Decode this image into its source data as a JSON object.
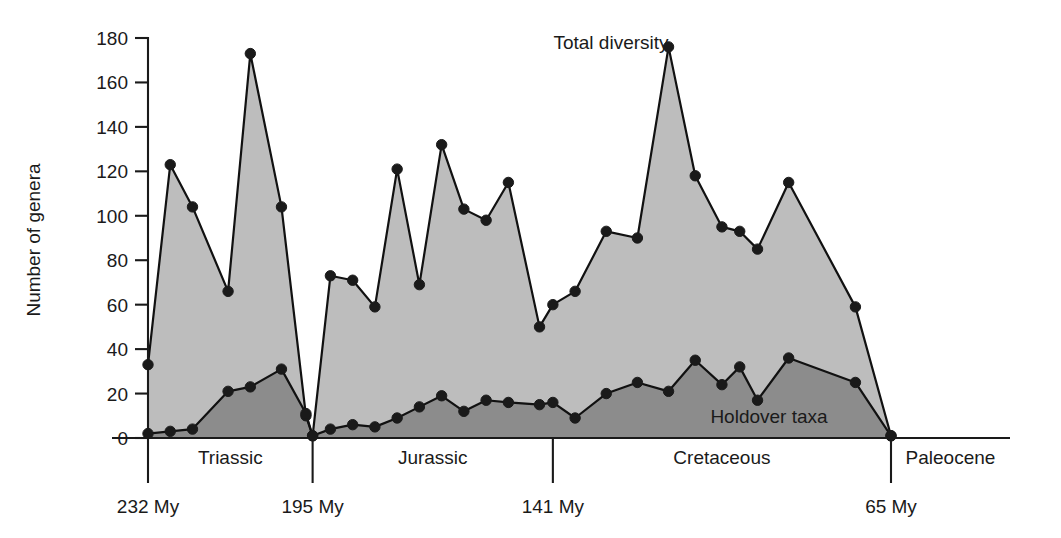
{
  "chart_data": {
    "type": "area",
    "title": "",
    "xlabel": "",
    "ylabel": "Number of genera",
    "ylim": [
      0,
      180
    ],
    "yticks": [
      0,
      20,
      40,
      60,
      80,
      100,
      120,
      140,
      160,
      180
    ],
    "ytick_labels": [
      "0",
      "20",
      "40",
      "60",
      "80",
      "100",
      "120",
      "140",
      "160",
      "180"
    ],
    "grid": false,
    "legend_position": "inline-annotation",
    "x_axis_direction": "time decreasing left to right (Ma)",
    "x_boundaries_my": [
      232,
      195,
      141,
      65
    ],
    "x_boundary_labels": [
      "232 My",
      "195 My",
      "141 My",
      "65 My"
    ],
    "periods": [
      {
        "label": "Triassic",
        "start_my": 232,
        "end_my": 195
      },
      {
        "label": "Jurassic",
        "start_my": 195,
        "end_my": 141
      },
      {
        "label": "Cretaceous",
        "start_my": 141,
        "end_my": 65
      },
      {
        "label": "Paleocene",
        "start_my": 65,
        "end_my": 55
      }
    ],
    "annotations": [
      {
        "text": "Total diversity",
        "x_my": 156,
        "y": 170
      },
      {
        "text": "Holdover taxa",
        "x_my": 88,
        "y": 16
      }
    ],
    "series": [
      {
        "name": "Total diversity",
        "fill_color": "#bdbdbd",
        "values": [
          33,
          123,
          104,
          66,
          173,
          104,
          10,
          1,
          73,
          71,
          59,
          121,
          69,
          132,
          103,
          98,
          115,
          50,
          60,
          66,
          93,
          90,
          176,
          118,
          95,
          93,
          85,
          115,
          59,
          1
        ]
      },
      {
        "name": "Holdover taxa",
        "fill_color": "#8c8c8c",
        "values": [
          2,
          3,
          4,
          21,
          23,
          31,
          11,
          1,
          4,
          6,
          5,
          9,
          14,
          19,
          12,
          17,
          16,
          15,
          16,
          9,
          20,
          25,
          21,
          35,
          24,
          32,
          17,
          36,
          25,
          1
        ]
      }
    ],
    "x_positions_my": [
      232,
      227,
      222,
      214,
      209,
      202,
      196.5,
      195,
      191,
      186,
      181,
      176,
      171,
      166,
      161,
      156,
      151,
      144,
      141,
      136,
      129,
      122,
      115,
      109,
      103,
      99,
      95,
      88,
      73,
      65
    ]
  },
  "styling": {
    "background": "#ffffff",
    "axis_color": "#1a1a1a",
    "total_fill": "#bdbdbd",
    "holdover_fill": "#8c8c8c",
    "marker_color": "#1a1a1a"
  }
}
